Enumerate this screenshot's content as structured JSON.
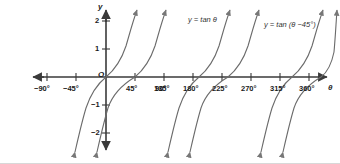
{
  "figure": {
    "background": "#ffffff",
    "axis_color": "#3a3a3a",
    "curve_color": "#6b6b6b",
    "text_color": "#1a1a1a"
  },
  "axes": {
    "x_axis_name": "θ",
    "y_axis_name": "y",
    "origin_label": "O",
    "x_ticks": [
      {
        "label": "−90°",
        "value": -90
      },
      {
        "label": "−45°",
        "value": -45
      },
      {
        "label": "45°",
        "value": 45
      },
      {
        "label": "90°",
        "value": 90
      },
      {
        "label": "135°",
        "value": 135
      },
      {
        "label": "180°",
        "value": 180
      },
      {
        "label": "225°",
        "value": 225
      },
      {
        "label": "270°",
        "value": 270
      },
      {
        "label": "315°",
        "value": 315
      },
      {
        "label": "360°",
        "value": 360
      }
    ],
    "y_ticks": [
      {
        "label": "2",
        "value": 2
      },
      {
        "label": "1",
        "value": 1
      },
      {
        "label": "−1",
        "value": -1
      },
      {
        "label": "−2",
        "value": -2
      }
    ]
  },
  "curve_labels": {
    "tan": "y = tan θ",
    "tan_shifted": "y = tan (θ −45°)"
  },
  "chart_data": {
    "type": "line",
    "title": "",
    "xlabel": "θ",
    "ylabel": "y",
    "xlim": [
      -115,
      385
    ],
    "ylim": [
      -2.75,
      2.6
    ],
    "grid": false,
    "legend": "inline-annotations",
    "x_tick_values": [
      -90,
      -45,
      45,
      90,
      135,
      180,
      225,
      270,
      315,
      360
    ],
    "y_tick_values": [
      2,
      1,
      -1,
      -2
    ],
    "series": [
      {
        "name": "y = tan θ",
        "equation": "y = tan(theta)",
        "period": 180,
        "zeros": [
          -180,
          0,
          180,
          360
        ],
        "asymptotes": [
          -90,
          90,
          270
        ],
        "branches": [
          {
            "domain": [
              -90,
              90
            ],
            "clipped_range": [
              -2.6,
              2.5
            ]
          },
          {
            "domain": [
              90,
              270
            ],
            "clipped_range": [
              -2.6,
              2.5
            ]
          },
          {
            "domain": [
              270,
              450
            ],
            "clipped_range": [
              -2.6,
              2.5
            ]
          }
        ]
      },
      {
        "name": "y = tan (θ −45°)",
        "equation": "y = tan(theta - 45)",
        "period": 180,
        "zeros": [
          -135,
          45,
          225,
          405
        ],
        "asymptotes": [
          -45,
          135,
          315
        ],
        "branches": [
          {
            "domain": [
              -45,
              135
            ],
            "clipped_range": [
              -2.6,
              2.5
            ]
          },
          {
            "domain": [
              135,
              315
            ],
            "clipped_range": [
              -2.6,
              2.5
            ]
          },
          {
            "domain": [
              315,
              495
            ],
            "clipped_range": [
              -2.6,
              2.5
            ]
          }
        ]
      }
    ]
  }
}
